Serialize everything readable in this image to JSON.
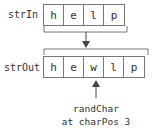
{
  "diagram": {
    "input": {
      "label": "strIn",
      "chars": [
        "h",
        "e",
        "l",
        "p"
      ]
    },
    "output": {
      "label": "strOut",
      "chars": [
        "h",
        "e",
        "w",
        "l",
        "p"
      ]
    },
    "annotation": {
      "line1": "randChar",
      "line2": "at charPos 3"
    },
    "colors": {
      "stroke": "#777777",
      "text": "#333333",
      "arrow": "#444444"
    }
  }
}
